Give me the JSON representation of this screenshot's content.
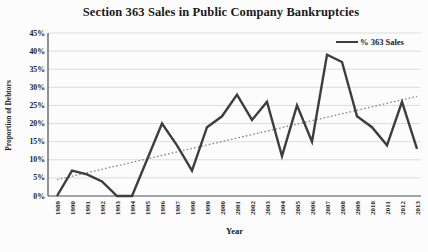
{
  "figure": {
    "title": "Section 363 Sales in Public Company Bankruptcies",
    "xlabel": "Year",
    "ylabel": "Proportion of Debtors",
    "legend_label": "% 363 Sales"
  },
  "chart_data": {
    "type": "line",
    "title": "Section 363 Sales in Public Company Bankruptcies",
    "xlabel": "Year",
    "ylabel": "Proportion of Debtors",
    "categories": [
      "1989",
      "1990",
      "1991",
      "1992",
      "1993",
      "1994",
      "1995",
      "1996",
      "1997",
      "1998",
      "1999",
      "2000",
      "2001",
      "2002",
      "2003",
      "2004",
      "2005",
      "2006",
      "2007",
      "2008",
      "2009",
      "2010",
      "2011",
      "2012",
      "2013"
    ],
    "series": [
      {
        "name": "% 363 Sales",
        "unit": "percent",
        "color": "#3d3d3d",
        "style": "solid",
        "values": [
          0,
          7,
          6,
          4,
          0,
          0,
          10,
          20,
          14,
          7,
          19,
          22,
          28,
          21,
          26,
          11,
          25,
          15,
          39,
          37,
          22,
          19,
          14,
          26,
          13
        ]
      }
    ],
    "trendline": {
      "type": "linear",
      "style": "dotted",
      "color": "#858585",
      "start_value": 4.5,
      "end_value": 27.5
    },
    "ylim": [
      0,
      45
    ],
    "ytick_step": 5,
    "ytick_labels": [
      "0%",
      "5%",
      "10%",
      "15%",
      "20%",
      "25%",
      "30%",
      "35%",
      "40%",
      "45%"
    ],
    "grid": true,
    "gridline_color": "#d9d9d9",
    "axis_color": "#4a4a4a",
    "legend_position": "top-right-inside"
  }
}
